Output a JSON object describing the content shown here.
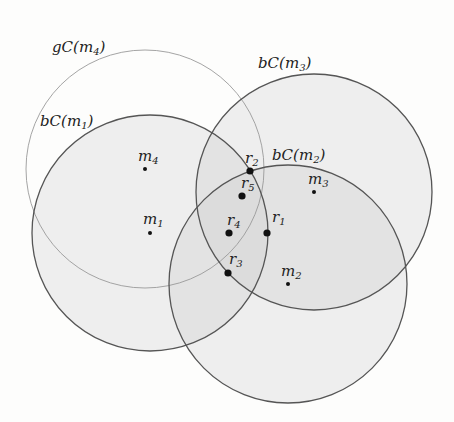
{
  "diagram": {
    "colors": {
      "fill": "#c8c8c8",
      "stroke_bold": "#555555",
      "stroke_light": "#9a9a9a",
      "point": "#111111"
    },
    "circles": [
      {
        "id": "gC_m4",
        "label_base": "gC(m",
        "label_sub": "4",
        "label_tail": ")",
        "cx": 145,
        "cy": 169,
        "r": 119,
        "style": "light",
        "label_x": 52,
        "label_y": 52
      },
      {
        "id": "bC_m1",
        "label_base": "bC(m",
        "label_sub": "1",
        "label_tail": ")",
        "cx": 150,
        "cy": 233,
        "r": 118,
        "style": "bold",
        "label_x": 40,
        "label_y": 126
      },
      {
        "id": "bC_m3",
        "label_base": "bC(m",
        "label_sub": "3",
        "label_tail": ")",
        "cx": 314,
        "cy": 192,
        "r": 118,
        "style": "bold",
        "label_x": 258,
        "label_y": 68
      },
      {
        "id": "bC_m2",
        "label_base": "bC(m",
        "label_sub": "2",
        "label_tail": ")",
        "cx": 288,
        "cy": 284,
        "r": 119,
        "style": "bold",
        "label_x": 272,
        "label_y": 160
      }
    ],
    "centers": [
      {
        "id": "m1",
        "base": "m",
        "sub": "1",
        "x": 150,
        "y": 233,
        "label_x": 143,
        "label_y": 224
      },
      {
        "id": "m2",
        "base": "m",
        "sub": "2",
        "x": 288,
        "y": 284,
        "label_x": 281,
        "label_y": 276
      },
      {
        "id": "m3",
        "base": "m",
        "sub": "3",
        "x": 314,
        "y": 192,
        "label_x": 308,
        "label_y": 184
      },
      {
        "id": "m4",
        "base": "m",
        "sub": "4",
        "x": 145,
        "y": 169,
        "label_x": 138,
        "label_y": 161
      }
    ],
    "points": [
      {
        "id": "r1",
        "base": "r",
        "sub": "1",
        "x": 267,
        "y": 233,
        "label_x": 272,
        "label_y": 222
      },
      {
        "id": "r2",
        "base": "r",
        "sub": "2",
        "x": 250,
        "y": 171,
        "label_x": 245,
        "label_y": 163
      },
      {
        "id": "r3",
        "base": "r",
        "sub": "3",
        "x": 228,
        "y": 273,
        "label_x": 229,
        "label_y": 264
      },
      {
        "id": "r4",
        "base": "r",
        "sub": "4",
        "x": 229,
        "y": 233,
        "label_x": 227,
        "label_y": 225
      },
      {
        "id": "r5",
        "base": "r",
        "sub": "5",
        "x": 242,
        "y": 196,
        "label_x": 241,
        "label_y": 188
      }
    ]
  }
}
